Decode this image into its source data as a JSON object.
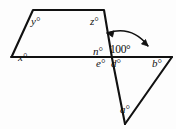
{
  "figure": {
    "background_color": "#fdfdfd",
    "stroke_color": "#111111",
    "arc_color": "#111111",
    "labels": [
      {
        "id": "y",
        "text": "y°",
        "x": 31,
        "y": 16,
        "kind": "variable"
      },
      {
        "id": "z",
        "text": "z°",
        "x": 90,
        "y": 16,
        "kind": "variable"
      },
      {
        "id": "x",
        "text": "x°",
        "x": 18,
        "y": 52,
        "kind": "variable"
      },
      {
        "id": "n",
        "text": "n°",
        "x": 93,
        "y": 46,
        "kind": "variable"
      },
      {
        "id": "given-100",
        "text": "100°",
        "x": 110,
        "y": 44,
        "kind": "given"
      },
      {
        "id": "e",
        "text": "e°",
        "x": 96,
        "y": 58,
        "kind": "variable"
      },
      {
        "id": "d",
        "text": "d°",
        "x": 111,
        "y": 58,
        "kind": "variable"
      },
      {
        "id": "b",
        "text": "b°",
        "x": 152,
        "y": 58,
        "kind": "variable"
      },
      {
        "id": "a",
        "text": "a°",
        "x": 120,
        "y": 104,
        "kind": "variable"
      }
    ],
    "vertices": {
      "quad_top_left": [
        33,
        10
      ],
      "quad_top_right": [
        104,
        10
      ],
      "quad_bottom_left": [
        12,
        56
      ],
      "crossing_point": [
        112,
        58
      ],
      "line_left_end": [
        11,
        57
      ],
      "line_right_end": [
        172,
        57
      ],
      "triangle_apex": [
        125,
        124
      ]
    },
    "arc": {
      "label": "100°",
      "double_headed": true,
      "description": "double-headed curved arrow spanning the 100 degree angle"
    }
  }
}
